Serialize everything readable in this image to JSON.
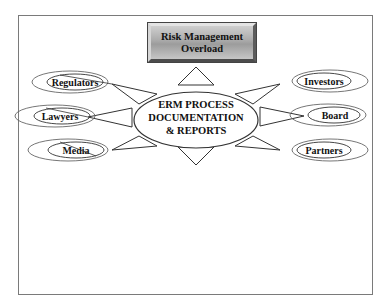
{
  "banner": {
    "line1": "Risk Management",
    "line2": "Overload"
  },
  "center": {
    "line1": "ERM PROCESS",
    "line2": "DOCUMENTATION",
    "line3": "& REPORTS"
  },
  "stakeholders": {
    "left": [
      {
        "label": "Regulators"
      },
      {
        "label": "Lawyers"
      },
      {
        "label": "Media"
      }
    ],
    "right": [
      {
        "label": "Investors"
      },
      {
        "label": "Board"
      },
      {
        "label": "Partners"
      }
    ]
  },
  "colors": {
    "stroke": "#333333",
    "banner_fill": "#a9a9a9",
    "background": "#ffffff"
  }
}
